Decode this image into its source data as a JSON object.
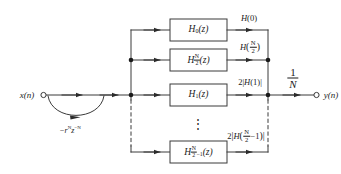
{
  "figure": {
    "kind": "block-diagram",
    "topic": "frequency-sampling-filter-structure",
    "line_color": "#3a3a3a",
    "text_color": "#1a1a1a",
    "background": "#ffffff"
  },
  "io": {
    "input_label": "x(n)",
    "output_label": "y(n)"
  },
  "feedback": {
    "label_prefix": "−r",
    "label_sup1": "N",
    "label_mid": "z",
    "label_sup2": "−N",
    "label_plain": "−r^N z^−N"
  },
  "gain": {
    "numerator": "1",
    "denominator": "N",
    "plain": "1/N"
  },
  "branches": [
    {
      "block_base": "H",
      "block_sub": "0",
      "block_arg": "(z)",
      "block_plain": "H0(z)",
      "out_plain": "H(0)",
      "out_kind": "simple",
      "out_pre": "",
      "out_fn": "H",
      "out_arg": "0"
    },
    {
      "block_base": "H",
      "block_sub": "N/2",
      "block_arg": "(z)",
      "block_plain": "H_N/2(z)",
      "out_plain": "H(N/2)",
      "out_kind": "frac",
      "out_pre": "",
      "out_fn": "H",
      "out_arg": "N/2"
    },
    {
      "block_base": "H",
      "block_sub": "1",
      "block_arg": "(z)",
      "block_plain": "H1(z)",
      "out_plain": "2|H(1)|",
      "out_kind": "abs",
      "out_pre": "2",
      "out_fn": "H",
      "out_arg": "1"
    },
    {
      "block_base": "H",
      "block_sub": "N/2−1",
      "block_arg": "(z)",
      "block_plain": "H_(N/2−1)(z)",
      "out_plain": "2|H(N/2−1)|",
      "out_kind": "abs-frac",
      "out_pre": "2",
      "out_fn": "H",
      "out_arg": "N/2−1"
    }
  ],
  "ellipsis": {
    "glyph": "⋮",
    "meaning": "continuation-of-branches"
  }
}
